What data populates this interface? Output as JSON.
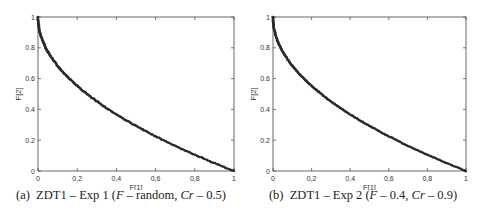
{
  "chart_data": [
    {
      "type": "scatter",
      "title": "",
      "caption": "(a) ZDT1 – Exp 1 (F – random, Cr – 0.5)",
      "xlabel": "F[1]",
      "ylabel": "F[2]",
      "xlim": [
        0,
        1
      ],
      "ylim": [
        0,
        1
      ],
      "xticks": [
        "0",
        "0,2",
        "0,4",
        "0,6",
        "0,8",
        "1"
      ],
      "yticks": [
        "0",
        "0.2",
        "0.4",
        "0.6",
        "0.8",
        "1"
      ],
      "grid": false,
      "series": [
        {
          "name": "Pareto front approximation",
          "marker": "dark dots",
          "function": "f2 = 1 - sqrt(f1)",
          "x": [
            0,
            0.01,
            0.04,
            0.09,
            0.16,
            0.25,
            0.36,
            0.49,
            0.64,
            0.81,
            1.0
          ],
          "y": [
            1.0,
            0.9,
            0.8,
            0.7,
            0.6,
            0.5,
            0.4,
            0.3,
            0.2,
            0.1,
            0.0
          ]
        }
      ]
    },
    {
      "type": "scatter",
      "title": "",
      "caption": "(b) ZDT1 – Exp 2 (F – 0.4, Cr – 0.9)",
      "xlabel": "F[1]",
      "ylabel": "F[2]",
      "xlim": [
        0,
        1
      ],
      "ylim": [
        0,
        1
      ],
      "xticks": [
        "0",
        "0,2",
        "0,4",
        "0,6",
        "0,8",
        "1"
      ],
      "yticks": [
        "0",
        "0.2",
        "0.4",
        "0.6",
        "0.8",
        "1"
      ],
      "grid": false,
      "series": [
        {
          "name": "Pareto front approximation",
          "marker": "dark dots",
          "function": "f2 = 1 - sqrt(f1)",
          "x": [
            0,
            0.01,
            0.04,
            0.09,
            0.16,
            0.25,
            0.36,
            0.49,
            0.64,
            0.81,
            1.0
          ],
          "y": [
            1.0,
            0.9,
            0.8,
            0.7,
            0.6,
            0.5,
            0.4,
            0.3,
            0.2,
            0.1,
            0.0
          ]
        }
      ]
    }
  ],
  "panels": [
    {
      "caption_prefix": "(a)",
      "caption_main": "ZDT1 – Exp 1 (",
      "caption_f": "F",
      "caption_f_val": " – random, ",
      "caption_cr": "Cr",
      "caption_cr_val": " – 0.5)",
      "xlabel": "F[1]",
      "ylabel": "F[2]"
    },
    {
      "caption_prefix": "(b)",
      "caption_main": "ZDT1 – Exp 2 (",
      "caption_f": "F",
      "caption_f_val": " – 0.4, ",
      "caption_cr": "Cr",
      "caption_cr_val": " – 0.9)",
      "xlabel": "F[1]",
      "ylabel": "F[2]"
    }
  ],
  "xticks": [
    "0",
    "0,2",
    "0,4",
    "0,6",
    "0,8",
    "1"
  ],
  "yticks": [
    "0",
    "0.2",
    "0.4",
    "0.6",
    "0.8",
    "1"
  ],
  "colors": {
    "axis": "#444444",
    "points": "#2a2a2a",
    "text": "#222222"
  }
}
